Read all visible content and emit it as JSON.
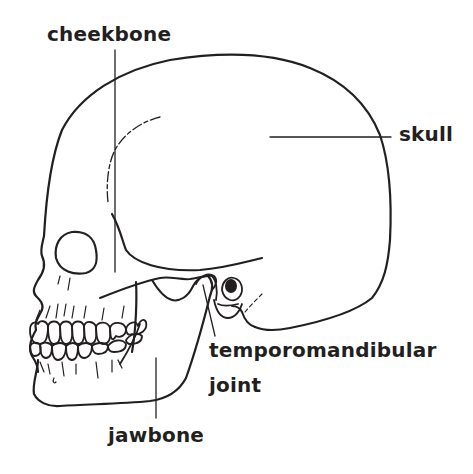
{
  "diagram": {
    "line_color": "#231f20",
    "background": "#ffffff",
    "labels": {
      "cheekbone": "cheekbone",
      "skull": "skull",
      "temporomandibular_line1": "temporomandibular",
      "temporomandibular_line2": "joint",
      "jawbone": "jawbone"
    }
  }
}
